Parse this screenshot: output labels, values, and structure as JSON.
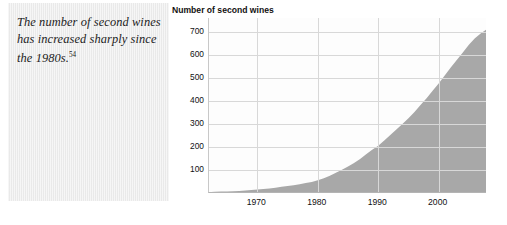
{
  "caption": {
    "text": "The number of second wines has increased sharply since the 1980s.",
    "footnote": "54"
  },
  "chart_data": {
    "type": "area",
    "title": "Number of second wines",
    "xlabel": "",
    "ylabel": "",
    "xlim": [
      1962,
      2008
    ],
    "ylim": [
      0,
      760
    ],
    "ytick_values": [
      100,
      200,
      300,
      400,
      500,
      600,
      700
    ],
    "ytick_labels": [
      "100",
      "200",
      "300",
      "400",
      "500",
      "600",
      "700"
    ],
    "xtick_values": [
      1970,
      1980,
      1990,
      2000
    ],
    "xtick_labels": [
      "1970",
      "1980",
      "1990",
      "2000"
    ],
    "grid": true,
    "legend": "none",
    "fill_color": "#a8a8a8",
    "grid_color": "#d8d8d8",
    "x": [
      1962,
      1963,
      1964,
      1965,
      1966,
      1967,
      1968,
      1969,
      1970,
      1971,
      1972,
      1973,
      1974,
      1975,
      1976,
      1977,
      1978,
      1979,
      1980,
      1981,
      1982,
      1983,
      1984,
      1985,
      1986,
      1987,
      1988,
      1989,
      1990,
      1991,
      1992,
      1993,
      1994,
      1995,
      1996,
      1997,
      1998,
      1999,
      2000,
      2001,
      2002,
      2003,
      2004,
      2005,
      2006,
      2007,
      2008
    ],
    "values": [
      4,
      5,
      6,
      7,
      8,
      9,
      11,
      13,
      15,
      17,
      20,
      23,
      27,
      30,
      34,
      38,
      43,
      48,
      55,
      64,
      75,
      88,
      101,
      115,
      130,
      148,
      168,
      188,
      205,
      228,
      252,
      276,
      300,
      325,
      352,
      382,
      412,
      444,
      476,
      510,
      545,
      578,
      610,
      644,
      672,
      694,
      712
    ]
  }
}
